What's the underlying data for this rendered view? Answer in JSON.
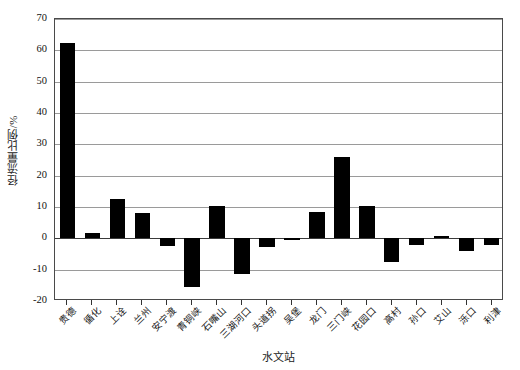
{
  "chart_data": {
    "type": "bar",
    "title": "",
    "xlabel": "水文站",
    "ylabel": "径流量比例/%",
    "ylim": [
      -20,
      70
    ],
    "ytick_step": 10,
    "yticks": [
      70,
      60,
      50,
      40,
      30,
      20,
      10,
      0,
      -10,
      -20
    ],
    "ytick_labels": [
      "70",
      "60",
      "50",
      "40",
      "30",
      "20",
      "10",
      "0",
      "-10",
      "-20"
    ],
    "grid": true,
    "grid_axis": "y",
    "legend": "none",
    "bar_color": "#000000",
    "categories": [
      "贵德",
      "循化",
      "上诠",
      "兰州",
      "安宁渡",
      "青铜峡",
      "石嘴山",
      "三湖河口",
      "头道拐",
      "吴堡",
      "龙门",
      "三门峡",
      "花园口",
      "高村",
      "孙口",
      "艾山",
      "泺口",
      "利津"
    ],
    "values": [
      62.5,
      1.6,
      12.6,
      8.0,
      -2.5,
      -15.5,
      10.2,
      -11.5,
      -2.8,
      -0.6,
      8.4,
      25.9,
      10.4,
      -7.6,
      -2.2,
      0.9,
      -4.2,
      -2.0
    ],
    "series": [
      {
        "name": "径流量比例",
        "values": [
          62.5,
          1.6,
          12.6,
          8.0,
          -2.5,
          -15.5,
          10.2,
          -11.5,
          -2.8,
          -0.6,
          8.4,
          25.9,
          10.4,
          -7.6,
          -2.2,
          0.9,
          -4.2,
          -2.0
        ]
      }
    ]
  },
  "axis": {
    "y_title": "径流量比例/%",
    "x_title": "水文站"
  }
}
